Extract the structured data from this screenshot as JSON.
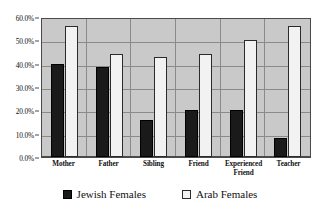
{
  "chart_data": {
    "type": "bar",
    "title": "",
    "subtitle": "",
    "xlabel": "",
    "ylabel": "",
    "ylim": [
      0,
      60
    ],
    "y_tick_labels": [
      "0.0%",
      "10.0%",
      "20.0%",
      "30.0%",
      "40.0%",
      "50.0%",
      "60.0%"
    ],
    "y_tick_values": [
      0,
      10,
      20,
      30,
      40,
      50,
      60
    ],
    "grid": true,
    "legend_position": "bottom",
    "categories": [
      "Mother",
      "Father",
      "Sibling",
      "Friend",
      "Experienced Friend",
      "Teacher"
    ],
    "series": [
      {
        "name": "Jewish Females",
        "color": "#1a1a1a",
        "values": [
          40.0,
          38.5,
          16.0,
          20.0,
          20.0,
          8.0
        ]
      },
      {
        "name": "Arab Females",
        "color": "#f2f2f2",
        "values": [
          56.0,
          44.0,
          43.0,
          44.0,
          50.0,
          56.0
        ]
      }
    ]
  },
  "legend": {
    "items": [
      {
        "label": "Jewish Females",
        "swatch": "dark-swatch"
      },
      {
        "label": "Arab Females",
        "swatch": "light-swatch"
      }
    ]
  }
}
